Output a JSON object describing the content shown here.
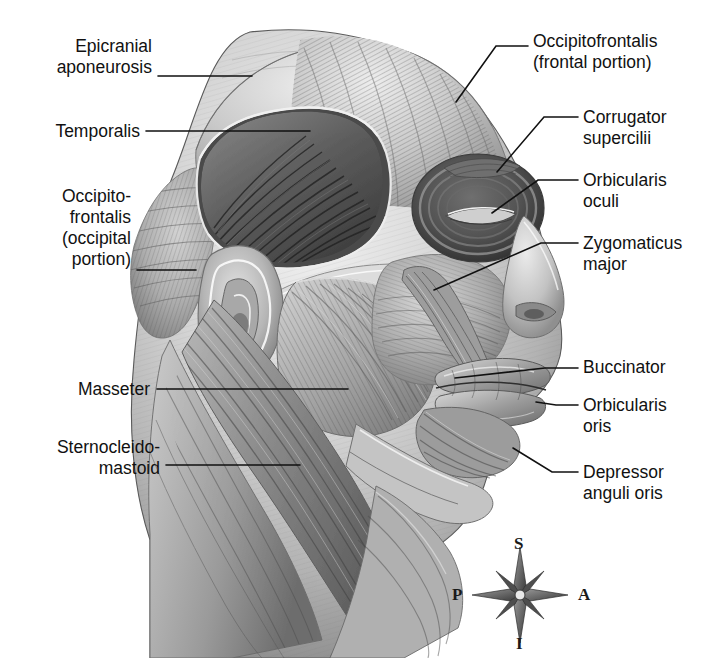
{
  "figure": {
    "style": "grayscale pencil/airbrush medical illustration",
    "background_color": "#ffffff",
    "ink_color": "#111111"
  },
  "labels": [
    {
      "id": "epicranial-aponeurosis",
      "text": "Epicranial\naponeurosis",
      "align": "right",
      "x": 152,
      "y": 36,
      "leader": [
        [
          158,
          76
        ],
        [
          252,
          76
        ]
      ]
    },
    {
      "id": "temporalis",
      "text": "Temporalis",
      "align": "right",
      "x": 140,
      "y": 121,
      "leader": [
        [
          146,
          131
        ],
        [
          310,
          131
        ]
      ]
    },
    {
      "id": "occipitofrontalis-occipital",
      "text": "Occipito-\nfrontalis\n(occipital\nportion)",
      "align": "right",
      "x": 131,
      "y": 186,
      "leader": [
        [
          137,
          270
        ],
        [
          196,
          270
        ]
      ]
    },
    {
      "id": "masseter",
      "text": "Masseter",
      "align": "right",
      "x": 150,
      "y": 379,
      "leader": [
        [
          157,
          389
        ],
        [
          348,
          389
        ]
      ]
    },
    {
      "id": "sternocleidomastoid",
      "text": "Sternocleido-\nmastoid",
      "align": "right",
      "x": 160,
      "y": 437,
      "leader": [
        [
          166,
          465
        ],
        [
          300,
          465
        ]
      ]
    },
    {
      "id": "occipitofrontalis-frontal",
      "text": "Occipitofrontalis\n(frontal portion)",
      "align": "left",
      "x": 533,
      "y": 31,
      "leader": [
        [
          456,
          102
        ],
        [
          496,
          46
        ],
        [
          528,
          46
        ]
      ]
    },
    {
      "id": "corrugator-supercilii",
      "text": "Corrugator\nsupercilii",
      "align": "left",
      "x": 583,
      "y": 107,
      "leader": [
        [
          497,
          172
        ],
        [
          544,
          117
        ],
        [
          578,
          117
        ]
      ]
    },
    {
      "id": "orbicularis-oculi",
      "text": "Orbicularis\noculi",
      "align": "left",
      "x": 583,
      "y": 170,
      "leader": [
        [
          492,
          213
        ],
        [
          538,
          180
        ],
        [
          578,
          180
        ]
      ]
    },
    {
      "id": "zygomaticus-major",
      "text": "Zygomaticus\nmajor",
      "align": "left",
      "x": 583,
      "y": 233,
      "leader": [
        [
          434,
          290
        ],
        [
          541,
          243
        ],
        [
          578,
          243
        ]
      ]
    },
    {
      "id": "buccinator",
      "text": "Buccinator",
      "align": "left",
      "x": 583,
      "y": 357,
      "leader": [
        [
          455,
          378
        ],
        [
          578,
          367
        ]
      ]
    },
    {
      "id": "orbicularis-oris",
      "text": "Orbicularis\noris",
      "align": "left",
      "x": 583,
      "y": 395,
      "leader": [
        [
          536,
          402
        ],
        [
          556,
          405
        ],
        [
          578,
          405
        ]
      ]
    },
    {
      "id": "depressor-anguli-oris",
      "text": "Depressor\nanguli oris",
      "align": "left",
      "x": 583,
      "y": 462,
      "leader": [
        [
          513,
          448
        ],
        [
          552,
          472
        ],
        [
          578,
          472
        ]
      ]
    }
  ],
  "compass": {
    "label_superior": "S",
    "label_inferior": "I",
    "label_posterior": "P",
    "label_anterior": "A",
    "center_x": 520,
    "center_y": 595
  }
}
